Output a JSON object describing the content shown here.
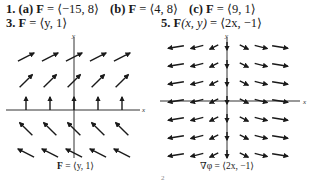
{
  "answers": {
    "line1": [
      {
        "num": "1.",
        "part": "(a)",
        "lhs": "F",
        "eq": " = ",
        "rhs": "⟨−15, 8⟩"
      },
      {
        "part": "(b)",
        "lhs": "F",
        "eq": " = ",
        "rhs": "⟨4, 8⟩"
      },
      {
        "part": "(c)",
        "lhs": "F",
        "eq": " = ",
        "rhs": "⟨9, 1⟩"
      }
    ],
    "line2_left": {
      "num": "3.",
      "lhs": "F",
      "eq": " = ",
      "rhs": "⟨y, 1⟩"
    },
    "line2_right": {
      "num": "5.",
      "lhs": "F",
      "args": "(x, y)",
      "eq": " = ",
      "rhs": "⟨2x, −1⟩"
    }
  },
  "figures": [
    {
      "id": "fig-3",
      "caption_bold": "F",
      "caption_rest": " = ⟨y, 1⟩",
      "x_label": "x",
      "y_label": "y",
      "field": "⟨y, 1⟩"
    },
    {
      "id": "fig-5",
      "caption_bold": "∇φ",
      "caption_rest": " = ⟨2x, −1⟩",
      "x_label": "x",
      "y_label": "y",
      "field": "⟨2x, −1⟩"
    }
  ],
  "page_fragment": "2",
  "colors": {
    "ink": "#1a1a1a",
    "axis": "#333333"
  }
}
